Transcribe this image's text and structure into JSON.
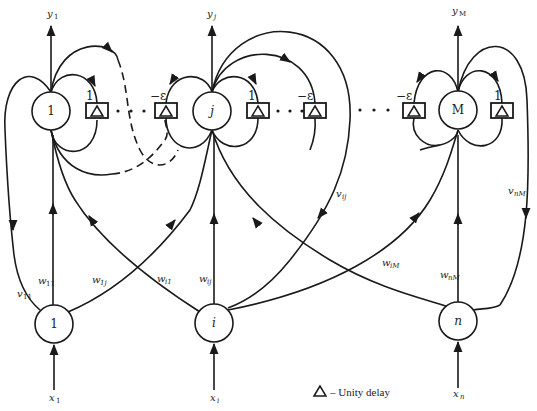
{
  "diagram": {
    "type": "recurrent-network (Hamming/MAXNET style)",
    "output_nodes": [
      {
        "id": "1",
        "label": "1",
        "output": "y",
        "output_sub": "1"
      },
      {
        "id": "j",
        "label": "j",
        "output": "y",
        "output_sub": "j"
      },
      {
        "id": "M",
        "label": "M",
        "output": "y",
        "output_sub": "M"
      }
    ],
    "input_nodes": [
      {
        "id": "1",
        "label": "1",
        "input": "x",
        "input_sub": "1"
      },
      {
        "id": "i",
        "label": "i",
        "input": "x",
        "input_sub": "i"
      },
      {
        "id": "n",
        "label": "n",
        "input": "x",
        "input_sub": "n"
      }
    ],
    "delay_weights": {
      "self": "1",
      "lateral": "−ε"
    },
    "edge_labels": {
      "w11": {
        "main": "w",
        "sub": "11"
      },
      "w1j": {
        "main": "w",
        "sub": "1j"
      },
      "wi1": {
        "main": "w",
        "sub": "i1"
      },
      "wij": {
        "main": "w",
        "sub": "ij"
      },
      "wiM": {
        "main": "w",
        "sub": "iM"
      },
      "wnM": {
        "main": "w",
        "sub": "nM"
      },
      "v11": {
        "main": "v",
        "sub": "11"
      },
      "vij": {
        "main": "v",
        "sub": "ij"
      },
      "vnM": {
        "main": "v",
        "sub": "nM"
      }
    },
    "legend": {
      "symbol": "△",
      "text": "– Unity delay"
    }
  }
}
